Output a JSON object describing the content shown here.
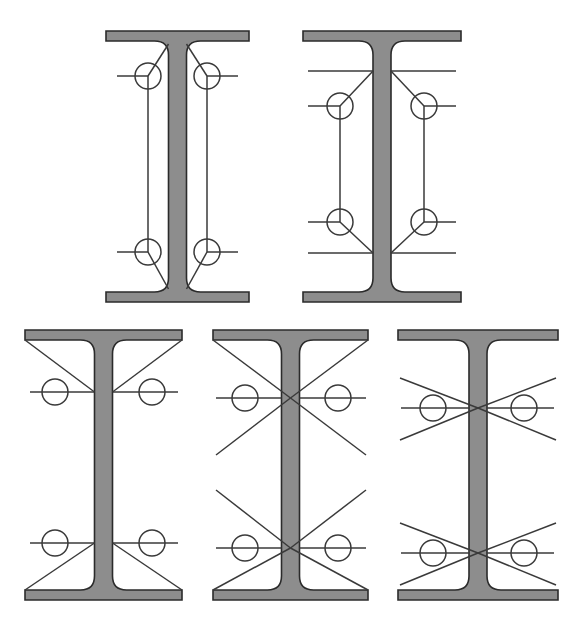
{
  "document": {
    "title": "I-Beam Cross-Section Weld Detail Figures",
    "background_color": "#ffffff",
    "width": 576,
    "height": 637
  },
  "style": {
    "beam_fill_color": "#8d8d8d",
    "beam_outline_color": "#2b2b2b",
    "beam_outline_width": 1.6,
    "detail_line_color": "#3a3a3a",
    "detail_line_width": 1.5,
    "weld_circle_radius": 13
  },
  "figures": [
    {
      "id": "figure-1",
      "name": "top-left-beam",
      "row": "top",
      "column": 1,
      "beam": {
        "left": 106,
        "right": 249,
        "top": 31,
        "bottom": 302,
        "flange_thickness": 10,
        "web_half_width": 9,
        "fillet_radius": 14
      },
      "weld_marks": [
        {
          "name": "weld-upper-left",
          "cx": 148,
          "cy": 76,
          "lead_in": "left",
          "diagonal": "up-right",
          "stub": "down"
        },
        {
          "name": "weld-upper-right",
          "cx": 207,
          "cy": 76,
          "lead_in": "right",
          "diagonal": "up-left",
          "stub": "down"
        },
        {
          "name": "weld-lower-left",
          "cx": 148,
          "cy": 252,
          "lead_in": "left",
          "diagonal": "down-right",
          "stub": "up"
        },
        {
          "name": "weld-lower-right",
          "cx": 207,
          "cy": 252,
          "lead_in": "right",
          "diagonal": "down-left",
          "stub": "up"
        }
      ],
      "lead_line_outer_x": {
        "left": 117,
        "right": 238
      },
      "diagonal_targets": {
        "top_y": 44,
        "bottom_y": 289
      },
      "vertical_connectors": true
    },
    {
      "id": "figure-2",
      "name": "top-right-beam",
      "row": "top",
      "column": 2,
      "beam": {
        "left": 303,
        "right": 461,
        "top": 31,
        "bottom": 302,
        "flange_thickness": 10,
        "web_half_width": 9,
        "fillet_radius": 14
      },
      "weld_marks": [
        {
          "name": "weld-upper-left",
          "cx": 340,
          "cy": 106,
          "lead_in": "left",
          "diagonal": "up-right",
          "stub": "down"
        },
        {
          "name": "weld-upper-right",
          "cx": 424,
          "cy": 106,
          "lead_in": "right",
          "diagonal": "up-left",
          "stub": "down"
        },
        {
          "name": "weld-lower-left",
          "cx": 340,
          "cy": 222,
          "lead_in": "left",
          "diagonal": "down-right",
          "stub": "up"
        },
        {
          "name": "weld-lower-right",
          "cx": 424,
          "cy": 222,
          "lead_in": "right",
          "diagonal": "down-left",
          "stub": "up"
        }
      ],
      "lead_line_outer_x": {
        "left": 308,
        "right": 456
      },
      "reference_lines_y": {
        "upper": 71,
        "lower": 253
      },
      "diagonal_targets": {
        "top_y": 71,
        "bottom_y": 253
      },
      "vertical_connectors": true
    },
    {
      "id": "figure-3",
      "name": "bottom-left-beam",
      "row": "bottom",
      "column": 1,
      "beam": {
        "left": 25,
        "right": 182,
        "top": 330,
        "bottom": 600,
        "flange_thickness": 10,
        "web_half_width": 9,
        "fillet_radius": 14
      },
      "weld_marks": [
        {
          "name": "weld-upper-left",
          "cx": 55,
          "cy": 392,
          "lead_in": "left",
          "diagonal": "none",
          "stub": "none"
        },
        {
          "name": "weld-upper-right",
          "cx": 152,
          "cy": 392,
          "lead_in": "right",
          "diagonal": "none",
          "stub": "none"
        },
        {
          "name": "weld-lower-left",
          "cx": 55,
          "cy": 543,
          "lead_in": "left",
          "diagonal": "none",
          "stub": "none"
        },
        {
          "name": "weld-lower-right",
          "cx": 152,
          "cy": 543,
          "lead_in": "right",
          "diagonal": "none",
          "stub": "none"
        }
      ],
      "horizontal_lines_y": [
        392,
        543
      ],
      "horizontal_line_extent": {
        "left": 30,
        "right": 178
      },
      "brace_style": "flange-tip-to-web-single",
      "brace_web_y": {
        "upper": 392,
        "lower": 543
      }
    },
    {
      "id": "figure-4",
      "name": "bottom-center-beam",
      "row": "bottom",
      "column": 2,
      "beam": {
        "left": 213,
        "right": 368,
        "top": 330,
        "bottom": 600,
        "flange_thickness": 10,
        "web_half_width": 9,
        "fillet_radius": 14
      },
      "weld_marks": [
        {
          "name": "weld-upper-left",
          "cx": 245,
          "cy": 398,
          "lead_in": "left",
          "diagonal": "none",
          "stub": "none"
        },
        {
          "name": "weld-upper-right",
          "cx": 338,
          "cy": 398,
          "lead_in": "right",
          "diagonal": "none",
          "stub": "none"
        },
        {
          "name": "weld-lower-left",
          "cx": 245,
          "cy": 548,
          "lead_in": "left",
          "diagonal": "none",
          "stub": "none"
        },
        {
          "name": "weld-lower-right",
          "cx": 338,
          "cy": 548,
          "lead_in": "right",
          "diagonal": "none",
          "stub": "none"
        }
      ],
      "horizontal_lines_y": [
        398,
        548
      ],
      "horizontal_line_extent": {
        "left": 216,
        "right": 366
      },
      "brace_style": "x-cross-touching-flange",
      "brace_node_y": {
        "upper": 398,
        "lower": 548
      },
      "brace_open_end_y": {
        "upper": 455,
        "lower": 490
      }
    },
    {
      "id": "figure-5",
      "name": "bottom-right-beam",
      "row": "bottom",
      "column": 3,
      "beam": {
        "left": 398,
        "right": 558,
        "top": 330,
        "bottom": 600,
        "flange_thickness": 10,
        "web_half_width": 9,
        "fillet_radius": 14
      },
      "weld_marks": [
        {
          "name": "weld-upper-left",
          "cx": 433,
          "cy": 408,
          "lead_in": "left",
          "diagonal": "none",
          "stub": "none"
        },
        {
          "name": "weld-upper-right",
          "cx": 524,
          "cy": 408,
          "lead_in": "right",
          "diagonal": "none",
          "stub": "none"
        },
        {
          "name": "weld-lower-left",
          "cx": 433,
          "cy": 553,
          "lead_in": "left",
          "diagonal": "none",
          "stub": "none"
        },
        {
          "name": "weld-lower-right",
          "cx": 524,
          "cy": 553,
          "lead_in": "right",
          "diagonal": "none",
          "stub": "none"
        }
      ],
      "horizontal_lines_y": [
        408,
        553
      ],
      "horizontal_line_extent": {
        "left": 401,
        "right": 554
      },
      "brace_style": "x-cross-free-floating",
      "brace_node_y": {
        "upper": 408,
        "lower": 553
      },
      "brace_end_top_y": {
        "upper": 378,
        "lower": 523
      },
      "brace_end_bottom_y": {
        "upper": 440,
        "lower": 585
      },
      "brace_end_x": {
        "left": 400,
        "right": 556
      }
    }
  ]
}
